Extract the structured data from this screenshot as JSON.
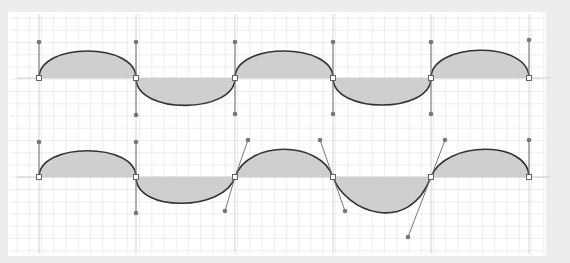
{
  "diagram": {
    "title": "",
    "colors": {
      "background": "#ededed",
      "panel": "#ffffff",
      "grid": "#e6e6e6",
      "axis": "#cccccc",
      "fill": "#cfcfcf",
      "curve": "#333333",
      "handle": "#777777"
    },
    "anchors_x": [
      39,
      136,
      235,
      333,
      431,
      529
    ],
    "rows": [
      {
        "name": "symmetric-handles-wave",
        "baseline_y": 78,
        "description": "Bezier wave with vertical tangent handles at each anchor",
        "handles": [
          {
            "anchor": [
              39,
              78
            ],
            "h": [
              [
                39,
                42
              ]
            ]
          },
          {
            "anchor": [
              136,
              78
            ],
            "h": [
              [
                136,
                42
              ],
              [
                136,
                115
              ]
            ]
          },
          {
            "anchor": [
              235,
              78
            ],
            "h": [
              [
                235,
                42
              ],
              [
                235,
                114
              ]
            ]
          },
          {
            "anchor": [
              333,
              78
            ],
            "h": [
              [
                333,
                42
              ],
              [
                333,
                114
              ]
            ]
          },
          {
            "anchor": [
              431,
              78
            ],
            "h": [
              [
                431,
                42
              ],
              [
                431,
                114
              ]
            ]
          },
          {
            "anchor": [
              529,
              78
            ],
            "h": [
              [
                529,
                40
              ]
            ]
          }
        ]
      },
      {
        "name": "skewed-handles-wave",
        "baseline_y": 177,
        "description": "Bezier wave with angled tangent handles",
        "handles": [
          {
            "anchor": [
              39,
              177
            ],
            "h": [
              [
                39,
                142
              ]
            ]
          },
          {
            "anchor": [
              136,
              177
            ],
            "h": [
              [
                136,
                142
              ],
              [
                136,
                213
              ]
            ]
          },
          {
            "anchor": [
              235,
              177
            ],
            "h": [
              [
                248,
                140
              ],
              [
                225,
                211
              ]
            ]
          },
          {
            "anchor": [
              333,
              177
            ],
            "h": [
              [
                320,
                140
              ],
              [
                345,
                211
              ]
            ]
          },
          {
            "anchor": [
              431,
              177
            ],
            "h": [
              [
                445,
                140
              ],
              [
                408,
                237
              ]
            ]
          },
          {
            "anchor": [
              529,
              177
            ],
            "h": [
              [
                529,
                140
              ]
            ]
          }
        ]
      }
    ]
  }
}
